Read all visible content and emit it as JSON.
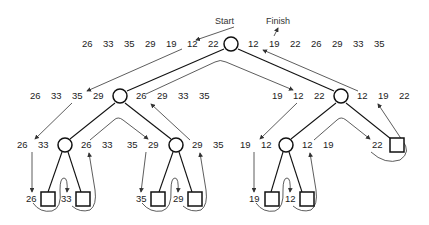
{
  "labels": {
    "start": "Start",
    "finish": "Finish"
  },
  "rows": {
    "root_in": [
      "26",
      "33",
      "35",
      "29",
      "19",
      "12",
      "22"
    ],
    "root_out": [
      "12",
      "19",
      "22",
      "26",
      "29",
      "33",
      "35"
    ],
    "l1_left_in": [
      "26",
      "33",
      "35",
      "29"
    ],
    "l1_left_out": [
      "26",
      "29",
      "33",
      "35"
    ],
    "l1_right_in": [
      "19",
      "12",
      "22"
    ],
    "l1_right_out": [
      "12",
      "19",
      "22"
    ],
    "l2a_in": [
      "26",
      "33"
    ],
    "l2a_out": [
      "26",
      "33"
    ],
    "l2b_in": [
      "35",
      "29"
    ],
    "l2b_out": [
      "29",
      "35"
    ],
    "l2c_in": [
      "19",
      "12"
    ],
    "l2c_out": [
      "12",
      "19"
    ],
    "l2d_in": [
      "22"
    ],
    "leaves": [
      "26",
      "33",
      "35",
      "29",
      "19",
      "12"
    ]
  }
}
